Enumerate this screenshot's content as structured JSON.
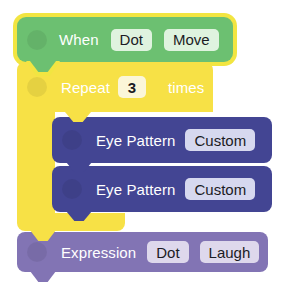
{
  "canvas": {
    "background": "#ffffff",
    "width": 292,
    "height": 296
  },
  "program": {
    "name": "block-script",
    "blocks": [
      {
        "id": "when",
        "type": "event-hat",
        "label": "When",
        "color": "#6cc071",
        "selected": true,
        "selection_color": "#f2e541",
        "fields": [
          {
            "name": "target",
            "value": "Dot"
          },
          {
            "name": "event",
            "value": "Move"
          }
        ]
      },
      {
        "id": "repeat",
        "type": "loop-c",
        "label_before": "Repeat",
        "label_after": "times",
        "color": "#f7e146",
        "fields": [
          {
            "name": "count",
            "value": "3"
          }
        ]
      },
      {
        "id": "eye-pattern-1",
        "type": "action",
        "label": "Eye Pattern",
        "color": "#434593",
        "fields": [
          {
            "name": "pattern",
            "value": "Custom"
          }
        ]
      },
      {
        "id": "eye-pattern-2",
        "type": "action",
        "label": "Eye Pattern",
        "color": "#434593",
        "fields": [
          {
            "name": "pattern",
            "value": "Custom"
          }
        ]
      },
      {
        "id": "expression",
        "type": "action",
        "label": "Expression",
        "color": "#8274b4",
        "fields": [
          {
            "name": "target",
            "value": "Dot"
          },
          {
            "name": "emotion",
            "value": "Laugh"
          }
        ]
      }
    ]
  }
}
